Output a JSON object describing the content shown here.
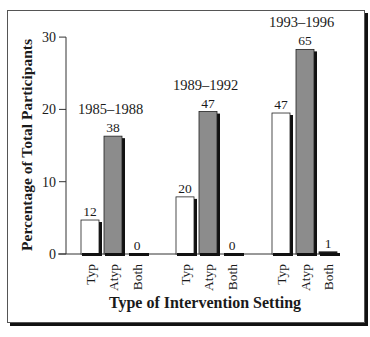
{
  "chart_data": {
    "type": "bar",
    "title": "",
    "xlabel": "Type of Intervention Setting",
    "ylabel": "Percentage of Total Participants",
    "ylim": [
      0,
      30
    ],
    "yticks": [
      0,
      10,
      20,
      30
    ],
    "grid": false,
    "legend": null,
    "groups": [
      {
        "label": "1985–1988",
        "bars": [
          {
            "category": "Typ",
            "value": 4.7,
            "count_label": "12",
            "fill": "white"
          },
          {
            "category": "Atyp",
            "value": 16.3,
            "count_label": "38",
            "fill": "gray"
          },
          {
            "category": "Both",
            "value": 0,
            "count_label": "0",
            "fill": "black"
          }
        ]
      },
      {
        "label": "1989–1992",
        "bars": [
          {
            "category": "Typ",
            "value": 7.9,
            "count_label": "20",
            "fill": "white"
          },
          {
            "category": "Atyp",
            "value": 19.7,
            "count_label": "47",
            "fill": "gray"
          },
          {
            "category": "Both",
            "value": 0,
            "count_label": "0",
            "fill": "black"
          }
        ]
      },
      {
        "label": "1993–1996",
        "bars": [
          {
            "category": "Typ",
            "value": 19.5,
            "count_label": "47",
            "fill": "white"
          },
          {
            "category": "Atyp",
            "value": 28.3,
            "count_label": "65",
            "fill": "gray"
          },
          {
            "category": "Both",
            "value": 0.3,
            "count_label": "1",
            "fill": "black"
          }
        ]
      }
    ],
    "categories": [
      "Typ",
      "Atyp",
      "Both"
    ],
    "series": [
      {
        "name": "1985–1988",
        "values": [
          4.7,
          16.3,
          0
        ]
      },
      {
        "name": "1989–1992",
        "values": [
          7.9,
          19.7,
          0
        ]
      },
      {
        "name": "1993–1996",
        "values": [
          19.5,
          28.3,
          0.3
        ]
      }
    ]
  },
  "colors": {
    "typ_fill": "#ffffff",
    "atyp_fill": "#8c8c8c",
    "both_fill": "#1a1a1a",
    "shadow": "#111111",
    "axis": "#333333"
  }
}
